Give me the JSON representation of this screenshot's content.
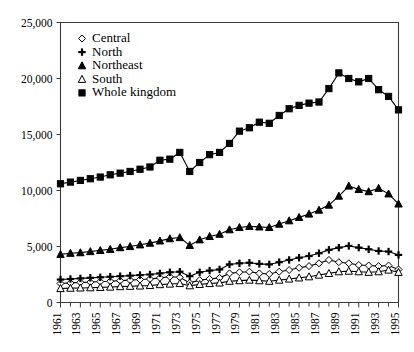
{
  "chart_data": {
    "type": "line",
    "title": "",
    "xlabel": "",
    "ylabel": "",
    "xlim": [
      1961,
      1995
    ],
    "ylim": [
      0,
      25000
    ],
    "grid": false,
    "legend_position": "top-left inside plot",
    "x": [
      1961,
      1962,
      1963,
      1964,
      1965,
      1966,
      1967,
      1968,
      1969,
      1970,
      1971,
      1972,
      1973,
      1974,
      1975,
      1976,
      1977,
      1978,
      1979,
      1980,
      1981,
      1982,
      1983,
      1984,
      1985,
      1986,
      1987,
      1988,
      1989,
      1990,
      1991,
      1992,
      1993,
      1994,
      1995
    ],
    "ytick_labels": [
      "0",
      "5,000",
      "10,000",
      "15,000",
      "20,000",
      "25,000"
    ],
    "ytick_values": [
      0,
      5000,
      10000,
      15000,
      20000,
      25000
    ],
    "xtick_labels": [
      "1961",
      "1963",
      "1965",
      "1967",
      "1969",
      "1971",
      "1973",
      "1975",
      "1977",
      "1979",
      "1981",
      "1983",
      "1985",
      "1987",
      "1989",
      "1991",
      "1993",
      "1995"
    ],
    "xtick_values": [
      1961,
      1963,
      1965,
      1967,
      1969,
      1971,
      1973,
      1975,
      1977,
      1979,
      1981,
      1983,
      1985,
      1987,
      1989,
      1991,
      1993,
      1995
    ],
    "series": [
      {
        "name": "Central",
        "marker": "open-diamond",
        "values": [
          1700,
          1750,
          1800,
          1820,
          1870,
          1900,
          1950,
          2000,
          2050,
          2100,
          2200,
          2300,
          2250,
          1750,
          2000,
          2100,
          2200,
          2600,
          2700,
          2750,
          2600,
          2550,
          2750,
          2900,
          3100,
          3250,
          3500,
          3800,
          3600,
          3500,
          3350,
          3300,
          3250,
          3300,
          2950
        ]
      },
      {
        "name": "North",
        "marker": "filled-plus",
        "values": [
          2050,
          2100,
          2150,
          2200,
          2250,
          2300,
          2350,
          2400,
          2450,
          2500,
          2600,
          2700,
          2750,
          2350,
          2700,
          2850,
          2950,
          3400,
          3500,
          3550,
          3450,
          3400,
          3600,
          3800,
          4000,
          4150,
          4400,
          4700,
          4900,
          5050,
          4900,
          4750,
          4600,
          4550,
          4250
        ]
      },
      {
        "name": "Northeast",
        "marker": "filled-triangle",
        "values": [
          4300,
          4400,
          4450,
          4550,
          4650,
          4750,
          4900,
          5000,
          5150,
          5300,
          5500,
          5700,
          5800,
          5100,
          5600,
          5900,
          6100,
          6500,
          6700,
          6800,
          6750,
          6700,
          7000,
          7300,
          7600,
          7900,
          8250,
          8700,
          9500,
          10400,
          10100,
          9900,
          10200,
          9700,
          8800
        ]
      },
      {
        "name": "South",
        "marker": "open-triangle",
        "values": [
          1250,
          1280,
          1300,
          1320,
          1350,
          1380,
          1420,
          1450,
          1480,
          1520,
          1600,
          1650,
          1700,
          1500,
          1620,
          1700,
          1750,
          1900,
          1950,
          2000,
          1950,
          1900,
          2000,
          2100,
          2200,
          2300,
          2450,
          2600,
          2750,
          2800,
          2750,
          2700,
          2750,
          2900,
          2700
        ]
      },
      {
        "name": "Whole kingdom",
        "marker": "filled-square",
        "values": [
          10600,
          10750,
          10900,
          11050,
          11200,
          11400,
          11550,
          11700,
          11900,
          12100,
          12700,
          12800,
          13400,
          11700,
          12500,
          13200,
          13400,
          14200,
          15300,
          15600,
          16100,
          16000,
          16700,
          17300,
          17600,
          17800,
          17900,
          19100,
          20500,
          20000,
          19700,
          20000,
          19000,
          18400,
          17200
        ]
      }
    ],
    "legend_entries": [
      {
        "label": "Central",
        "marker": "open-diamond"
      },
      {
        "label": "North",
        "marker": "filled-plus"
      },
      {
        "label": "Northeast",
        "marker": "filled-triangle"
      },
      {
        "label": "South",
        "marker": "open-triangle"
      },
      {
        "label": "Whole kingdom",
        "marker": "filled-square"
      }
    ],
    "colors": {
      "ink": "#000000",
      "axis": "#3a3a3a",
      "background": "#ffffff"
    }
  }
}
